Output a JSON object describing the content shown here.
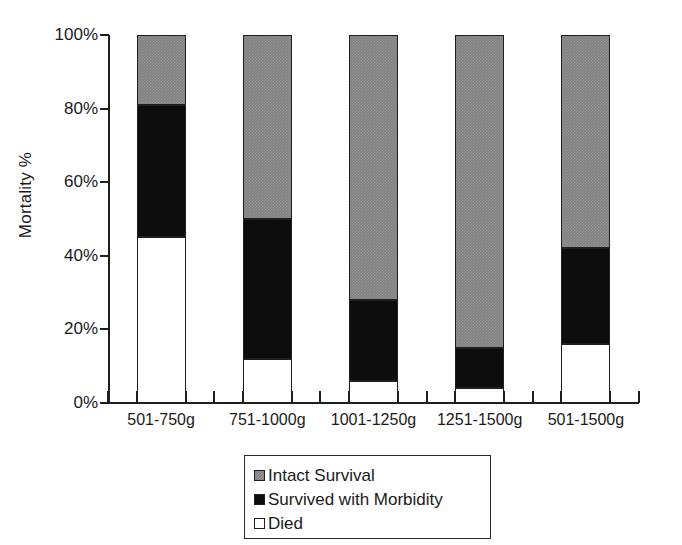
{
  "chart_data": {
    "type": "bar",
    "subtype": "stacked-100-percent",
    "title": "",
    "xlabel": "",
    "ylabel": "Mortality %",
    "ylim": [
      0,
      100
    ],
    "ytick_labels": [
      "0%",
      "20%",
      "40%",
      "60%",
      "80%",
      "100%"
    ],
    "ytick_values": [
      0,
      20,
      40,
      60,
      80,
      100
    ],
    "grid": false,
    "legend_position": "bottom-center",
    "categories": [
      "501-750g",
      "751-1000g",
      "1001-1250g",
      "1251-1500g",
      "501-1500g"
    ],
    "series": [
      {
        "name": "Intact Survival",
        "color": "#808080",
        "values": [
          19,
          50,
          72,
          85,
          58
        ]
      },
      {
        "name": "Survived with Morbidity",
        "color": "#0d0d0d",
        "values": [
          36,
          38,
          22,
          11,
          26
        ]
      },
      {
        "name": "Died",
        "color": "#ffffff",
        "values": [
          45,
          12,
          6,
          4,
          16
        ]
      }
    ],
    "stack_order_bottom_to_top": [
      "Died",
      "Survived with Morbidity",
      "Intact Survival"
    ]
  },
  "legend": {
    "items": [
      {
        "label": "Intact Survival",
        "swatch": "gray-swatch-icon"
      },
      {
        "label": "Survived with Morbidity",
        "swatch": "black-swatch-icon"
      },
      {
        "label": "Died",
        "swatch": "white-swatch-icon"
      }
    ]
  },
  "colors": {
    "intact_survival": "#808080",
    "survived_with_morbidity": "#0d0d0d",
    "died": "#ffffff",
    "axis": "#1f1f1f",
    "text": "#1a1a1a",
    "background": "#ffffff"
  }
}
